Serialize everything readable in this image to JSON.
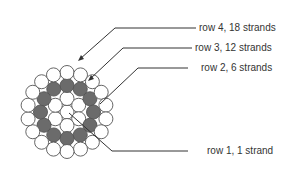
{
  "diagram": {
    "colors": {
      "light": "#ffffff",
      "dark": "#6b6b6b",
      "stroke": "#555555",
      "line": "#333333"
    },
    "center": {
      "x": 67,
      "y": 112
    },
    "strand_radius": 7,
    "rows": [
      {
        "label": "row 1, 1 strand",
        "count": 1,
        "ring_radius": 0,
        "fill": "light"
      },
      {
        "label": "row 2, 6 strands",
        "count": 6,
        "ring_radius": 13.5,
        "fill": "light"
      },
      {
        "label": "row 3, 12 strands",
        "count": 12,
        "ring_radius": 26.5,
        "fill": "dark"
      },
      {
        "label": "row 4, 18 strands",
        "count": 18,
        "ring_radius": 39.5,
        "fill": "light"
      }
    ],
    "labels": {
      "row4": "row 4, 18 strands",
      "row3": "row 3, 12 strands",
      "row2": "row 2, 6 strands",
      "row1": "row 1, 1 strand"
    }
  }
}
